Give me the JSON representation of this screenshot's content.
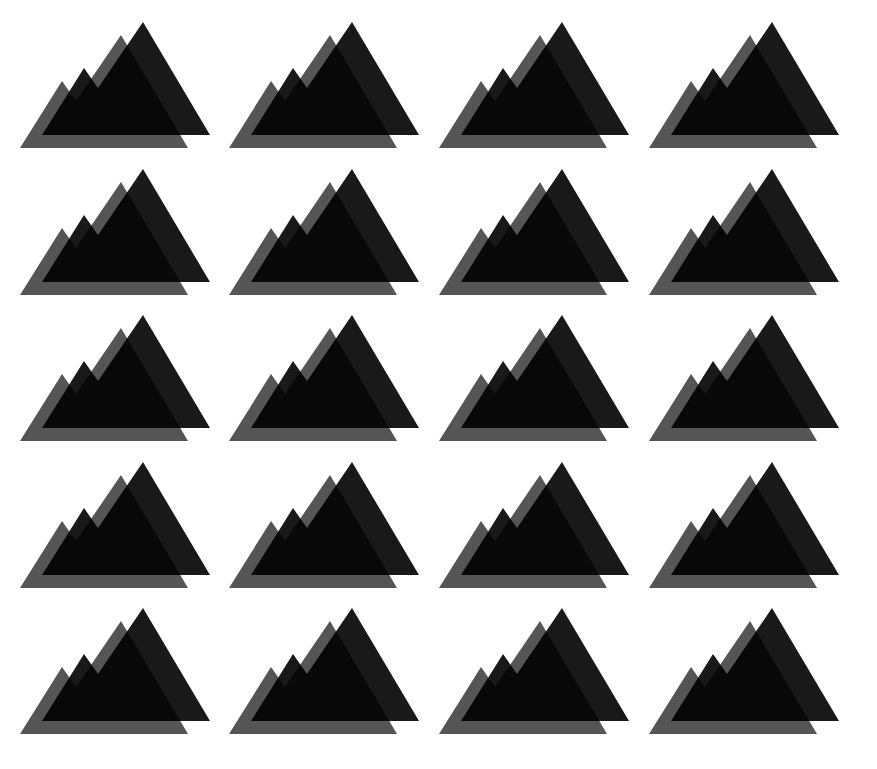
{
  "pattern": {
    "icon": "mountain-icon",
    "columns": 4,
    "rows": 5,
    "col_offsets": [
      0,
      209,
      419,
      629
    ],
    "row_offsets": [
      0,
      147,
      293,
      440,
      586
    ],
    "colors": {
      "background": "#ffffff",
      "back_layer": "#555555",
      "front_layer": "#000000",
      "front_layer_opacity": 0.9
    }
  }
}
